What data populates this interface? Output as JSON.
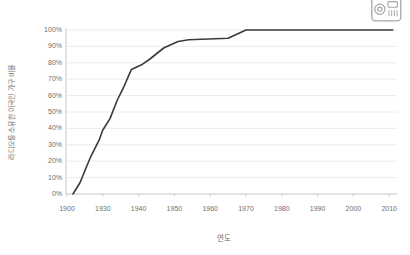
{
  "page": {
    "background": "#ffffff"
  },
  "icons": {
    "top_right_icon": "radio-icon"
  },
  "chart_data": {
    "type": "line",
    "title": "",
    "xlabel": "연도",
    "ylabel": "라디오를 소유한 미국인 가구 비율",
    "x_tick_labels": [
      "1900",
      "1930",
      "1940",
      "1950",
      "1960",
      "1970",
      "1980",
      "1990",
      "2000",
      "2010"
    ],
    "x_tick_years": [
      1900,
      1930,
      1940,
      1950,
      1960,
      1970,
      1980,
      1990,
      2000,
      2010
    ],
    "y_tick_labels": [
      "0%",
      "10%",
      "20%",
      "30%",
      "40%",
      "50%",
      "60%",
      "70%",
      "80%",
      "90%",
      "100%"
    ],
    "y_tick_values": [
      0,
      10,
      20,
      30,
      40,
      50,
      60,
      70,
      80,
      90,
      100
    ],
    "ylim": [
      0,
      100
    ],
    "grid": "horizontal",
    "legend": "none",
    "line_color": "#3b3b3b",
    "grid_color": "#ececec",
    "axis_color": "#c9c9c9",
    "label_color": "#6e6e6e",
    "series": [
      {
        "name": "라디오를 소유한 미국인 가구 비율",
        "points": [
          [
            1905,
            0
          ],
          [
            1911,
            7
          ],
          [
            1916,
            16
          ],
          [
            1920,
            23
          ],
          [
            1927,
            33
          ],
          [
            1930,
            39
          ],
          [
            1932,
            46
          ],
          [
            1934,
            57
          ],
          [
            1936,
            66
          ],
          [
            1938,
            76
          ],
          [
            1941,
            79
          ],
          [
            1943,
            82
          ],
          [
            1947,
            89
          ],
          [
            1951,
            93
          ],
          [
            1954,
            94
          ],
          [
            1965,
            95
          ],
          [
            1970,
            100
          ],
          [
            2011,
            100
          ]
        ]
      }
    ]
  }
}
